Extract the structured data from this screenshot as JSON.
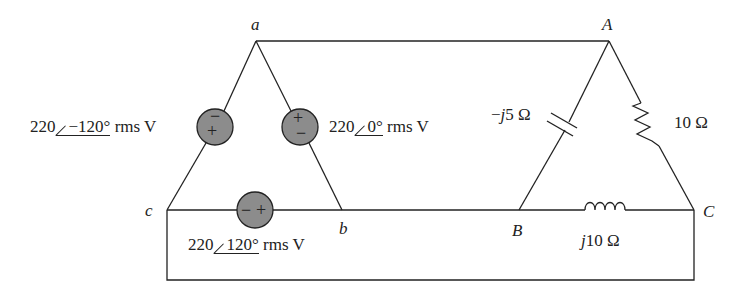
{
  "diagram": {
    "type": "three-phase delta-delta circuit",
    "nodes": {
      "a": "a",
      "b": "b",
      "c": "c",
      "A": "A",
      "B": "B",
      "C": "C"
    },
    "sources": [
      {
        "id": "Vca",
        "magnitude": "220",
        "angle": "−120°",
        "unit": "rms V",
        "polarity_top": "−",
        "polarity_bottom": "+"
      },
      {
        "id": "Vab",
        "magnitude": "220",
        "angle": "0°",
        "unit": "rms V",
        "polarity_top": "+",
        "polarity_bottom": "−"
      },
      {
        "id": "Vbc",
        "magnitude": "220",
        "angle": "120°",
        "unit": "rms V",
        "polarity_left": "−",
        "polarity_right": "+"
      }
    ],
    "loads": [
      {
        "id": "Z_AB",
        "type": "capacitor",
        "prefix": "−",
        "j": "j",
        "value": "5 Ω"
      },
      {
        "id": "Z_AC",
        "type": "resistor",
        "label": "10 Ω"
      },
      {
        "id": "Z_BC",
        "type": "inductor",
        "j": "j",
        "value": "10 Ω"
      }
    ],
    "colors": {
      "wire": "#222222",
      "source_fill": "#8c8c8c",
      "background": "#ffffff"
    }
  }
}
